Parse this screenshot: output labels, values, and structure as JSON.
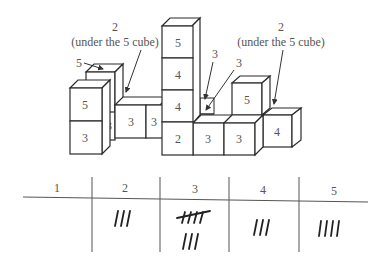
{
  "annotations": {
    "left_note_count": "2",
    "left_note_text": "(under the 5 cube)",
    "right_note_count": "2",
    "right_note_text": "(under the 5 cube)",
    "back_top_label": "5",
    "hidden_label_1": "3",
    "hidden_label_2": "3"
  },
  "cubes": {
    "tall_column": [
      "2",
      "4",
      "4",
      "5"
    ],
    "left_stack": [
      "3",
      "5"
    ],
    "middle_row": [
      "3",
      "3",
      "3"
    ],
    "right_front_row": [
      "3",
      "3"
    ],
    "right_top": "5",
    "right_end": "4"
  },
  "tally_table": {
    "headers": [
      "1",
      "2",
      "3",
      "4",
      "5"
    ],
    "tallies": [
      0,
      3,
      8,
      3,
      4
    ]
  }
}
